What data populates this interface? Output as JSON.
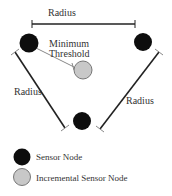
{
  "diagram": {
    "labels": {
      "top_radius": "Radius",
      "left_radius": "Radius",
      "right_radius": "Radius",
      "threshold_line1": "Minimum",
      "threshold_line2": "Threshold"
    },
    "nodes": [
      {
        "id": "top-left",
        "type": "sensor",
        "cx": 29,
        "cy": 43
      },
      {
        "id": "top-right",
        "type": "sensor",
        "cx": 143,
        "cy": 42
      },
      {
        "id": "bottom",
        "type": "sensor",
        "cx": 82,
        "cy": 121
      },
      {
        "id": "incremental",
        "type": "incremental",
        "cx": 83,
        "cy": 70
      }
    ],
    "colors": {
      "sensor": "#0d0d0d",
      "incremental": "#c8c8c8",
      "line": "#222222",
      "threshold_line": "#888888"
    }
  },
  "legend": {
    "items": [
      {
        "label": "Sensor Node",
        "type": "sensor"
      },
      {
        "label": "Incremental Sensor Node",
        "type": "incremental"
      }
    ]
  }
}
